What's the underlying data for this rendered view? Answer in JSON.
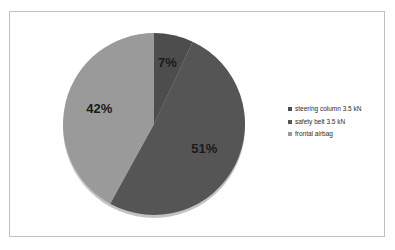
{
  "chart_data": {
    "type": "pie",
    "title": "",
    "subtitle": "",
    "xlabel": "",
    "ylabel": "",
    "grid": false,
    "legend_position": "right",
    "start_angle_deg": 0,
    "direction": "clockwise",
    "categories": [
      "steering column 3.5 kN",
      "safety belt 3.5 kN",
      "frontal airbag"
    ],
    "values": [
      7,
      51,
      42
    ],
    "value_unit": "%",
    "data_labels": [
      "7%",
      "51%",
      "42%"
    ],
    "colors": [
      "#4d4d4d",
      "#555555",
      "#9a9a9a"
    ],
    "slices": [
      {
        "label": "steering column 3.5 kN",
        "value": 7,
        "data_label": "7%",
        "color": "#4d4d4d"
      },
      {
        "label": "safety belt 3.5 kN",
        "value": 51,
        "data_label": "51%",
        "color": "#555555"
      },
      {
        "label": "frontal airbag",
        "value": 42,
        "data_label": "42%",
        "color": "#9a9a9a"
      }
    ]
  },
  "legend": {
    "items": [
      {
        "marker_name": "legend-swatch-steering-column",
        "label": "steering column 3.5 kN",
        "color": "#4d4d4d"
      },
      {
        "marker_name": "legend-swatch-safety-belt",
        "label": "safety belt 3.5 kN",
        "color": "#555555"
      },
      {
        "marker_name": "legend-swatch-frontal-airbag",
        "label": "frontal airbag",
        "color": "#9a9a9a"
      }
    ]
  },
  "style": {
    "frame_border_color": "#bfbfbf",
    "background_color": "#ffffff",
    "label_text_color": "#1a1a1a",
    "legend_text_color": "#2b2b2b"
  }
}
